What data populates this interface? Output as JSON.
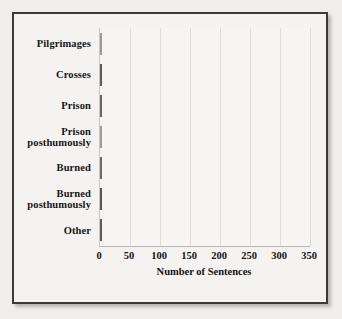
{
  "figure": {
    "background_color": "#efeeec",
    "frame_color": "#3a3a3a",
    "plot_background": "#f6f5f3"
  },
  "chart_data": {
    "type": "bar",
    "orientation": "horizontal",
    "title": "",
    "xlabel": "Number of Sentences",
    "ylabel": "",
    "categories": [
      "Pilgrimages",
      "Crosses",
      "Prison",
      "Prison posthumously",
      "Burned",
      "Burned posthumously",
      "Other"
    ],
    "values": [
      20,
      135,
      310,
      20,
      37,
      70,
      50
    ],
    "bar_colors": [
      "#b9b8b6",
      "#5b5b5b",
      "#6d6d6d",
      "#bcbbb9",
      "#767676",
      "#565656",
      "#5e5e5e"
    ],
    "xlim": [
      0,
      350
    ],
    "xticks": [
      0,
      50,
      100,
      150,
      200,
      250,
      300,
      350
    ],
    "xtick_labels": [
      "0",
      "50",
      "100",
      "150",
      "200",
      "250",
      "300",
      "350"
    ],
    "grid": "vertical",
    "legend": null
  }
}
